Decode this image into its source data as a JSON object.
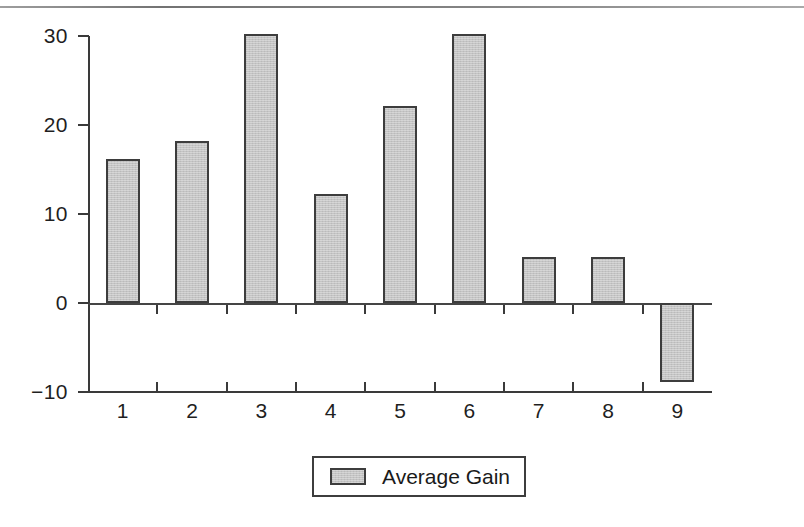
{
  "figure": {
    "kind": "scanned-bar-chart",
    "background": "#ffffff",
    "bar_fill": "#c4c4c4",
    "bar_border": "#3d3d3d",
    "axis_color": "#3a3a3a",
    "text_color": "#1a1a1a"
  },
  "legend": {
    "label": "Average Gain",
    "swatch_icon": "legend-swatch-icon",
    "position": "bottom-center",
    "boxed": true
  },
  "chart_data": {
    "type": "bar",
    "title": "",
    "xlabel": "",
    "ylabel": "",
    "categories": [
      "1",
      "2",
      "3",
      "4",
      "5",
      "6",
      "7",
      "8",
      "9"
    ],
    "values": [
      16.2,
      18.2,
      30.2,
      12.3,
      22.1,
      30.2,
      5.2,
      5.2,
      -8.9
    ],
    "series": [
      {
        "name": "Average Gain",
        "values": [
          16.2,
          18.2,
          30.2,
          12.3,
          22.1,
          30.2,
          5.2,
          5.2,
          -8.9
        ]
      }
    ],
    "ylim": [
      -10,
      30
    ],
    "yticks": [
      30,
      20,
      10,
      0,
      -10
    ],
    "ytick_labels": [
      "30",
      "20",
      "10",
      "0",
      "−10"
    ],
    "xticks": [
      1,
      2,
      3,
      4,
      5,
      6,
      7,
      8,
      9
    ],
    "grid": false,
    "legend_position": "bottom-center",
    "baseline": 0
  }
}
